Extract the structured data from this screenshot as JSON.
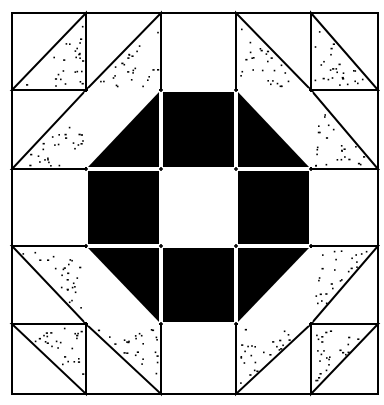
{
  "colors": {
    "background": "#ffffff",
    "line": "#000000",
    "solid": "#000000",
    "speckle": "#000000"
  },
  "grid": {
    "cols": [
      12,
      86,
      161,
      236,
      311,
      378
    ],
    "rows": [
      13,
      90,
      169,
      246,
      324,
      394
    ]
  },
  "cells": [
    {
      "r": 0,
      "c": 0,
      "type": "tri",
      "fill": "speckle",
      "corner": "br"
    },
    {
      "r": 0,
      "c": 1,
      "type": "tri",
      "fill": "speckle",
      "corner": "br"
    },
    {
      "r": 0,
      "c": 2,
      "type": "blank"
    },
    {
      "r": 0,
      "c": 3,
      "type": "tri",
      "fill": "speckle",
      "corner": "bl"
    },
    {
      "r": 0,
      "c": 4,
      "type": "tri",
      "fill": "speckle",
      "corner": "bl"
    },
    {
      "r": 1,
      "c": 0,
      "type": "tri",
      "fill": "speckle",
      "corner": "br"
    },
    {
      "r": 1,
      "c": 1,
      "type": "tri",
      "fill": "solid",
      "corner": "br"
    },
    {
      "r": 1,
      "c": 2,
      "type": "solid"
    },
    {
      "r": 1,
      "c": 3,
      "type": "tri",
      "fill": "solid",
      "corner": "bl"
    },
    {
      "r": 1,
      "c": 4,
      "type": "tri",
      "fill": "speckle",
      "corner": "bl"
    },
    {
      "r": 2,
      "c": 0,
      "type": "blank"
    },
    {
      "r": 2,
      "c": 1,
      "type": "solid"
    },
    {
      "r": 2,
      "c": 2,
      "type": "blank"
    },
    {
      "r": 2,
      "c": 3,
      "type": "solid"
    },
    {
      "r": 2,
      "c": 4,
      "type": "blank"
    },
    {
      "r": 3,
      "c": 0,
      "type": "tri",
      "fill": "speckle",
      "corner": "tr"
    },
    {
      "r": 3,
      "c": 1,
      "type": "tri",
      "fill": "solid",
      "corner": "tr"
    },
    {
      "r": 3,
      "c": 2,
      "type": "solid"
    },
    {
      "r": 3,
      "c": 3,
      "type": "tri",
      "fill": "solid",
      "corner": "tl"
    },
    {
      "r": 3,
      "c": 4,
      "type": "tri",
      "fill": "speckle",
      "corner": "tl"
    },
    {
      "r": 4,
      "c": 0,
      "type": "tri",
      "fill": "speckle",
      "corner": "tr"
    },
    {
      "r": 4,
      "c": 1,
      "type": "tri",
      "fill": "speckle",
      "corner": "tr"
    },
    {
      "r": 4,
      "c": 2,
      "type": "blank"
    },
    {
      "r": 4,
      "c": 3,
      "type": "tri",
      "fill": "speckle",
      "corner": "tl"
    },
    {
      "r": 4,
      "c": 4,
      "type": "tri",
      "fill": "speckle",
      "corner": "tl"
    }
  ]
}
